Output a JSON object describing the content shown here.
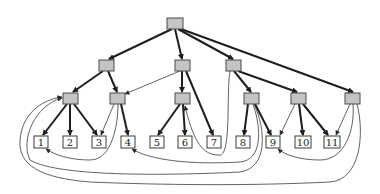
{
  "diagram": {
    "type": "tree-with-back-edges",
    "colors": {
      "inner_fill": "#c4c4c4",
      "leaf_fill": "#ffffff",
      "edge": "#1e1e1e"
    },
    "nodes": {
      "root": {
        "x": 167,
        "y": 18,
        "w": 16,
        "h": 11,
        "kind": "inner"
      },
      "a": {
        "x": 99,
        "y": 60,
        "w": 15,
        "h": 11,
        "kind": "inner"
      },
      "b": {
        "x": 175,
        "y": 60,
        "w": 15,
        "h": 11,
        "kind": "inner"
      },
      "c": {
        "x": 226,
        "y": 60,
        "w": 15,
        "h": 11,
        "kind": "inner"
      },
      "a1": {
        "x": 63,
        "y": 93,
        "w": 15,
        "h": 11,
        "kind": "inner"
      },
      "a2": {
        "x": 110,
        "y": 93,
        "w": 15,
        "h": 11,
        "kind": "inner"
      },
      "b1": {
        "x": 175,
        "y": 93,
        "w": 15,
        "h": 11,
        "kind": "inner"
      },
      "c1": {
        "x": 244,
        "y": 93,
        "w": 15,
        "h": 11,
        "kind": "inner"
      },
      "c2": {
        "x": 291,
        "y": 93,
        "w": 15,
        "h": 11,
        "kind": "inner"
      },
      "r3": {
        "x": 345,
        "y": 93,
        "w": 15,
        "h": 11,
        "kind": "inner"
      }
    },
    "leaves": [
      {
        "id": "1",
        "label": "1",
        "x": 34,
        "y": 136,
        "w": 14,
        "h": 12
      },
      {
        "id": "2",
        "label": "2",
        "x": 63,
        "y": 136,
        "w": 14,
        "h": 12
      },
      {
        "id": "3",
        "label": "3",
        "x": 92,
        "y": 136,
        "w": 14,
        "h": 12
      },
      {
        "id": "4",
        "label": "4",
        "x": 121,
        "y": 136,
        "w": 14,
        "h": 12
      },
      {
        "id": "5",
        "label": "5",
        "x": 150,
        "y": 136,
        "w": 14,
        "h": 12
      },
      {
        "id": "6",
        "label": "6",
        "x": 178,
        "y": 136,
        "w": 14,
        "h": 12
      },
      {
        "id": "7",
        "label": "7",
        "x": 207,
        "y": 136,
        "w": 14,
        "h": 12
      },
      {
        "id": "8",
        "label": "8",
        "x": 236,
        "y": 136,
        "w": 14,
        "h": 12
      },
      {
        "id": "9",
        "label": "9",
        "x": 266,
        "y": 136,
        "w": 14,
        "h": 12
      },
      {
        "id": "10",
        "label": "10",
        "x": 295,
        "y": 136,
        "w": 16,
        "h": 12
      },
      {
        "id": "11",
        "label": "11",
        "x": 324,
        "y": 136,
        "w": 16,
        "h": 12
      }
    ]
  }
}
